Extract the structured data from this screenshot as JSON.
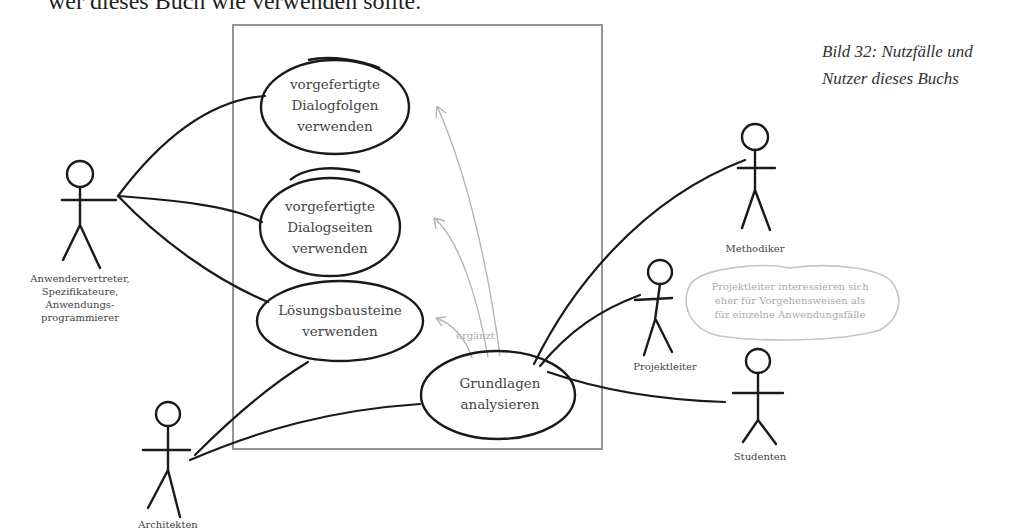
{
  "page": {
    "top_text_fragment": "wer dieses Buch wie verwenden sollte.",
    "caption_line1": "Bild 32: Nutzfälle und",
    "caption_line2": "Nutzer dieses Buchs"
  },
  "diagram": {
    "type": "use-case",
    "system_boundary": true,
    "use_cases": [
      {
        "id": "dialogfolgen",
        "lines": [
          "vorgefertigte",
          "Dialogfolgen",
          "verwenden"
        ]
      },
      {
        "id": "dialogseiten",
        "lines": [
          "vorgefertigte",
          "Dialogseiten",
          "verwenden"
        ]
      },
      {
        "id": "loesungsbausteine",
        "lines": [
          "Lösungsbausteine",
          "verwenden"
        ]
      },
      {
        "id": "grundlagen",
        "lines": [
          "Grundlagen",
          "analysieren"
        ]
      }
    ],
    "actors": [
      {
        "id": "anwender",
        "lines": [
          "Anwendervertreter,",
          "Spezifikateure,",
          "Anwendungs-",
          "programmierer"
        ]
      },
      {
        "id": "architekten",
        "lines": [
          "Architekten"
        ]
      },
      {
        "id": "methodiker",
        "lines": [
          "Methodiker"
        ]
      },
      {
        "id": "projektleiter",
        "lines": [
          "Projektleiter"
        ]
      },
      {
        "id": "studenten",
        "lines": [
          "Studenten"
        ]
      }
    ],
    "relation_label": "ergänzt",
    "note": {
      "lines": [
        "Projektleiter interessieren sich",
        "eher für Vorgehensweisen als",
        "für einzelne Anwendungsfälle"
      ]
    },
    "colors": {
      "stroke": "#1a1a1a",
      "boundary": "#8a8a8a",
      "extend_arrow": "#b5b5b5",
      "note": "#c4c4c4"
    }
  }
}
